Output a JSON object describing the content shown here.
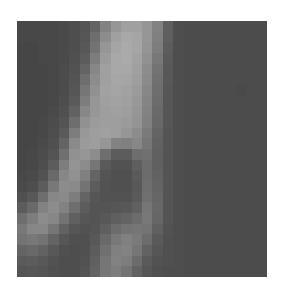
{
  "image": {
    "kind": "grayscale-pixelated-patch",
    "grid": {
      "cols": 24,
      "rows": 24
    },
    "background": "#ffffff",
    "rows": [
      [
        72,
        72,
        72,
        72,
        74,
        78,
        84,
        100,
        130,
        150,
        160,
        160,
        150,
        130,
        95,
        78,
        76,
        76,
        76,
        76,
        76,
        76,
        76,
        76
      ],
      [
        72,
        72,
        72,
        72,
        74,
        78,
        86,
        110,
        140,
        160,
        168,
        165,
        150,
        128,
        95,
        78,
        76,
        76,
        76,
        76,
        76,
        76,
        76,
        76
      ],
      [
        70,
        70,
        72,
        72,
        74,
        78,
        88,
        115,
        150,
        165,
        170,
        165,
        148,
        125,
        92,
        78,
        76,
        76,
        76,
        76,
        76,
        76,
        76,
        76
      ],
      [
        70,
        70,
        72,
        72,
        74,
        80,
        92,
        125,
        155,
        168,
        170,
        162,
        145,
        120,
        90,
        78,
        76,
        76,
        76,
        76,
        76,
        76,
        76,
        76
      ],
      [
        70,
        70,
        70,
        72,
        76,
        82,
        100,
        135,
        160,
        168,
        168,
        160,
        140,
        115,
        88,
        78,
        76,
        76,
        76,
        76,
        76,
        76,
        76,
        76
      ],
      [
        70,
        70,
        70,
        72,
        76,
        84,
        110,
        140,
        160,
        166,
        165,
        158,
        138,
        112,
        88,
        78,
        76,
        76,
        76,
        76,
        76,
        76,
        76,
        76
      ],
      [
        70,
        70,
        70,
        72,
        76,
        86,
        118,
        145,
        162,
        165,
        162,
        155,
        135,
        110,
        86,
        78,
        76,
        76,
        76,
        76,
        76,
        74,
        76,
        76
      ],
      [
        70,
        70,
        70,
        72,
        78,
        90,
        125,
        150,
        160,
        162,
        160,
        152,
        132,
        108,
        86,
        78,
        76,
        76,
        76,
        76,
        76,
        76,
        76,
        76
      ],
      [
        70,
        70,
        70,
        74,
        80,
        98,
        135,
        150,
        158,
        160,
        158,
        150,
        130,
        105,
        86,
        78,
        76,
        76,
        76,
        76,
        76,
        76,
        76,
        76
      ],
      [
        70,
        70,
        72,
        76,
        84,
        110,
        145,
        155,
        158,
        158,
        155,
        148,
        128,
        104,
        86,
        78,
        76,
        76,
        76,
        76,
        76,
        76,
        76,
        76
      ],
      [
        70,
        70,
        72,
        78,
        90,
        125,
        152,
        158,
        160,
        158,
        150,
        140,
        122,
        100,
        84,
        78,
        76,
        76,
        76,
        76,
        76,
        76,
        76,
        76
      ],
      [
        70,
        70,
        74,
        80,
        100,
        138,
        155,
        158,
        150,
        130,
        128,
        135,
        118,
        98,
        84,
        78,
        76,
        76,
        76,
        76,
        76,
        76,
        76,
        76
      ],
      [
        70,
        72,
        76,
        84,
        112,
        145,
        150,
        140,
        110,
        92,
        92,
        110,
        112,
        96,
        84,
        78,
        76,
        76,
        76,
        76,
        76,
        76,
        76,
        76
      ],
      [
        70,
        72,
        78,
        92,
        125,
        148,
        140,
        118,
        90,
        82,
        82,
        95,
        108,
        96,
        84,
        78,
        76,
        76,
        76,
        76,
        76,
        76,
        76,
        76
      ],
      [
        72,
        74,
        82,
        105,
        135,
        145,
        128,
        100,
        84,
        80,
        80,
        90,
        108,
        98,
        84,
        78,
        76,
        76,
        76,
        76,
        76,
        76,
        76,
        76
      ],
      [
        74,
        78,
        92,
        120,
        140,
        138,
        115,
        92,
        82,
        80,
        80,
        88,
        110,
        100,
        84,
        78,
        76,
        76,
        76,
        76,
        76,
        76,
        76,
        76
      ],
      [
        80,
        88,
        110,
        135,
        138,
        125,
        100,
        86,
        82,
        82,
        82,
        90,
        112,
        102,
        84,
        78,
        76,
        76,
        76,
        76,
        76,
        76,
        76,
        76
      ],
      [
        92,
        105,
        130,
        140,
        130,
        110,
        92,
        84,
        84,
        86,
        88,
        96,
        118,
        104,
        84,
        78,
        76,
        76,
        76,
        76,
        76,
        76,
        76,
        76
      ],
      [
        110,
        125,
        140,
        135,
        115,
        96,
        86,
        84,
        88,
        95,
        100,
        108,
        120,
        102,
        84,
        78,
        76,
        76,
        76,
        76,
        76,
        76,
        76,
        76
      ],
      [
        120,
        135,
        135,
        118,
        98,
        86,
        82,
        85,
        95,
        108,
        115,
        118,
        116,
        96,
        82,
        78,
        76,
        76,
        76,
        76,
        76,
        76,
        76,
        76
      ],
      [
        115,
        120,
        115,
        100,
        86,
        80,
        80,
        88,
        105,
        120,
        128,
        122,
        108,
        90,
        80,
        78,
        76,
        76,
        76,
        76,
        76,
        76,
        76,
        76
      ],
      [
        100,
        105,
        98,
        88,
        80,
        78,
        80,
        92,
        112,
        128,
        130,
        118,
        98,
        86,
        80,
        78,
        76,
        76,
        76,
        76,
        76,
        76,
        76,
        76
      ],
      [
        90,
        92,
        88,
        82,
        78,
        78,
        82,
        96,
        118,
        130,
        125,
        108,
        90,
        82,
        80,
        78,
        76,
        76,
        76,
        76,
        76,
        76,
        76,
        76
      ],
      [
        84,
        86,
        84,
        80,
        78,
        78,
        84,
        98,
        118,
        125,
        115,
        98,
        86,
        80,
        78,
        78,
        76,
        76,
        76,
        76,
        76,
        76,
        76,
        76
      ]
    ]
  }
}
